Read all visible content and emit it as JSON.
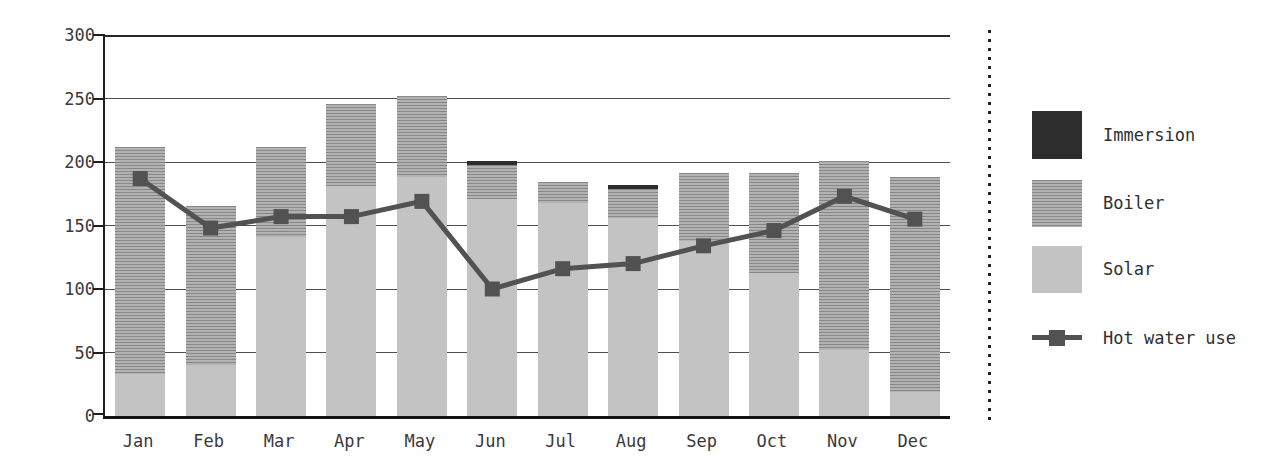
{
  "chart_data": {
    "type": "bar",
    "subtype": "stacked-bar-with-line-overlay",
    "title": "",
    "xlabel": "",
    "ylabel": "",
    "categories": [
      "Jan",
      "Feb",
      "Mar",
      "Apr",
      "May",
      "Jun",
      "Jul",
      "Aug",
      "Sep",
      "Oct",
      "Nov",
      "Dec"
    ],
    "ylim": [
      0,
      300
    ],
    "yticks": [
      0,
      50,
      100,
      150,
      200,
      250,
      300
    ],
    "grid": "horizontal",
    "legend_position": "right",
    "series": [
      {
        "name": "Solar",
        "type": "bar",
        "stack_order": 1,
        "color": "#c3c3c3",
        "values": [
          33,
          40,
          141,
          181,
          188,
          171,
          168,
          156,
          138,
          113,
          52,
          19
        ]
      },
      {
        "name": "Boiler",
        "type": "bar",
        "stack_order": 2,
        "color": "#9e9e9e",
        "pattern": "horizontal-hatch",
        "values": [
          179,
          125,
          71,
          65,
          64,
          27,
          16,
          23,
          53,
          78,
          149,
          169
        ]
      },
      {
        "name": "Immersion",
        "type": "bar",
        "stack_order": 3,
        "color": "#2d2d2d",
        "values": [
          0,
          0,
          0,
          0,
          0,
          3,
          0,
          3,
          0,
          0,
          0,
          0
        ]
      },
      {
        "name": "Hot water use",
        "type": "line",
        "color": "#525252",
        "marker": "square",
        "values": [
          187,
          148,
          157,
          157,
          169,
          100,
          116,
          120,
          134,
          146,
          173,
          155
        ]
      }
    ],
    "stacked_totals": [
      212,
      165,
      212,
      246,
      252,
      201,
      184,
      182,
      191,
      191,
      201,
      188
    ]
  },
  "legend": {
    "items": [
      {
        "label": "Immersion",
        "swatch": "immersion"
      },
      {
        "label": "Boiler",
        "swatch": "boiler"
      },
      {
        "label": "Solar",
        "swatch": "solar"
      },
      {
        "label": "Hot water use",
        "swatch": "line"
      }
    ]
  },
  "colors": {
    "background": "#ffffff",
    "axis": "#1e1e1e",
    "gridline": "#4f4f4f",
    "text": "#333333",
    "solar": "#c3c3c3",
    "boiler_hatch_dark": "#878787",
    "boiler_hatch_light": "#b2b2b2",
    "immersion": "#2d2d2d",
    "hot_water_line": "#525252"
  }
}
